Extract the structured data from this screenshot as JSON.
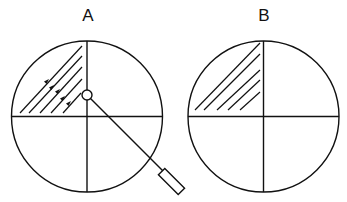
{
  "figure": {
    "panels": [
      {
        "label": "A",
        "description": "Circle divided into quadrants; upper-left quadrant hatched with diagonal lines bearing arrowheads; small circle at center attached to a probe with rectangular handle extending to lower right",
        "has_arrows": true,
        "has_probe": true
      },
      {
        "label": "B",
        "description": "Circle divided into quadrants; upper-left quadrant hatched with diagonal lines",
        "has_arrows": false,
        "has_probe": false
      }
    ],
    "stroke_color": "#111111",
    "background_color": "#ffffff"
  }
}
